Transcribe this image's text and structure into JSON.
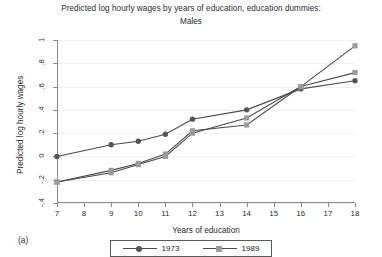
{
  "chart_title": {
    "line1": "Predicted log hourly wages by years of education, education dummies:",
    "line2": "Males"
  },
  "panel_label": "(a)",
  "axes": {
    "x_title": "Years of education",
    "y_title": "Predicted log hourly wages",
    "x_ticks": [
      "7",
      "8",
      "9",
      "10",
      "11",
      "12",
      "13",
      "14",
      "15",
      "16",
      "17",
      "18"
    ],
    "y_ticks": [
      "1",
      ".8",
      ".6",
      ".4",
      ".2",
      "0",
      "-.2",
      "-.4"
    ]
  },
  "legend": {
    "position": "bottom-center",
    "entries": [
      {
        "label": "1973",
        "color": "#555555",
        "marker": "circle"
      },
      {
        "label": "1989",
        "color": "#9a9a9a",
        "marker": "square"
      }
    ]
  },
  "colors": {
    "series_1973": "#555555",
    "series_1989": "#9a9a9a",
    "line_dark": "#4a4a4a",
    "axis": "#8a8a8a",
    "grid": "#f1f1f1",
    "text": "#2b2b2b"
  },
  "chart_data": {
    "type": "line",
    "title": "Predicted log hourly wages by years of education, education dummies: Males",
    "xlabel": "Years of education",
    "ylabel": "Predicted log hourly wages",
    "xlim": [
      7,
      18
    ],
    "ylim": [
      -0.4,
      1.0
    ],
    "grid": true,
    "x": [
      7,
      9,
      10,
      11,
      12,
      14,
      16,
      18
    ],
    "series": [
      {
        "name": "1973",
        "marker": "circle",
        "color": "#555555",
        "values": [
          0.0,
          0.1,
          0.13,
          0.19,
          0.32,
          0.4,
          0.58,
          0.65
        ]
      },
      {
        "name": "1989",
        "marker": "square",
        "color": "#9a9a9a",
        "values": [
          -0.22,
          -0.12,
          -0.06,
          0.02,
          0.22,
          0.27,
          0.6,
          0.95
        ]
      },
      {
        "name": "1989-fitted",
        "marker": "square",
        "color": "#9a9a9a",
        "values": [
          -0.22,
          -0.14,
          -0.07,
          0.0,
          0.2,
          0.33,
          0.6,
          0.72
        ]
      }
    ]
  }
}
